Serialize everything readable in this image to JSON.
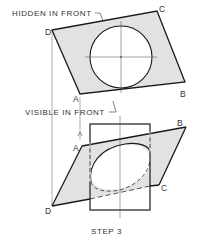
{
  "diagram": {
    "caption": "STEP 3",
    "colors": {
      "line": "#1a1a1a",
      "thin_line": "#555555",
      "fill": "#e2e2e2",
      "text": "#333333",
      "background": "#ffffff"
    },
    "top_view": {
      "label_hidden": "HIDDEN IN FRONT",
      "label_visible": "VISIBLE IN FRONT",
      "points": {
        "A": "A",
        "B": "B",
        "C": "C",
        "D": "D"
      },
      "circle": "circular hole with center lines"
    },
    "front_view": {
      "points": {
        "A": "A",
        "B": "B",
        "C": "C",
        "D": "D"
      },
      "ellipse": "elliptical intersection, partly hidden (dashed)"
    }
  }
}
